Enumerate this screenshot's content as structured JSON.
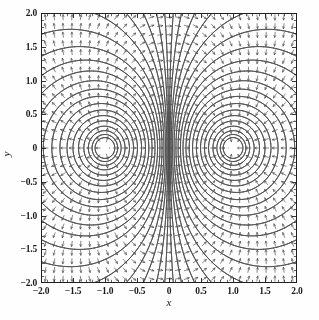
{
  "figure": {
    "width": 319,
    "height": 320,
    "background": "#fefefe",
    "ink_color": "#3a3a3a",
    "frame_color": "#1f1f1f"
  },
  "axes": {
    "frame": {
      "left": 41,
      "top": 13,
      "right": 297,
      "bottom": 283
    },
    "x_title": "x",
    "y_title": "y",
    "xlim": [
      -2.0,
      2.0
    ],
    "ylim": [
      -2.0,
      2.0
    ],
    "xticks": [
      -2.0,
      -1.5,
      -1.0,
      -0.5,
      0,
      0.5,
      1.0,
      1.5,
      2.0
    ],
    "xticklabels": [
      "-2.0",
      "-1.5",
      "-1.0",
      "-0.5",
      "0",
      "0.5",
      "1.0",
      "1.5",
      "2.0"
    ],
    "yticks": [
      -2.0,
      -1.5,
      -1.0,
      -0.5,
      0,
      0.5,
      1.0,
      1.5,
      2.0
    ],
    "yticklabels": [
      "-2.0",
      "-1.5",
      "-1.0",
      "-0.5",
      "0",
      "0.5",
      "1.0",
      "1.5",
      "2.0"
    ],
    "minor_ticks_per_interval": 5,
    "tick_direction": "in",
    "major_tick_length": 4,
    "minor_tick_length": 2.2,
    "grid": false,
    "legend": false,
    "title": ""
  },
  "chart_data": {
    "type": "contour-quiver",
    "title": "",
    "xlabel": "x",
    "ylabel": "y",
    "xlim": [
      -2.0,
      2.0
    ],
    "ylim": [
      -2.0,
      2.0
    ],
    "charges": [
      {
        "name": "charge-left",
        "x": -1.0,
        "y": 0.0,
        "q": 1.0
      },
      {
        "name": "charge-right",
        "x": 1.0,
        "y": 0.0,
        "q": -1.0
      }
    ],
    "contour": {
      "field": "potential",
      "levels": [
        -6.0,
        -4.5,
        -3.4,
        -2.6,
        -2.0,
        -1.6,
        -1.3,
        -1.05,
        -0.85,
        -0.7,
        -0.57,
        -0.46,
        -0.37,
        -0.29,
        -0.22,
        -0.16,
        -0.11,
        -0.07,
        -0.035,
        -0.012,
        0.012,
        0.035,
        0.07,
        0.11,
        0.16,
        0.22,
        0.29,
        0.37,
        0.46,
        0.57,
        0.7,
        0.85,
        1.05,
        1.3,
        1.6,
        2.0,
        2.6,
        3.4,
        4.5,
        6.0
      ],
      "line_color": "#4a4a4a",
      "line_width": 0.8
    },
    "quiver": {
      "field": "electric-field-direction",
      "grid_nx": 29,
      "grid_ny": 31,
      "arrow_length_px": 5.0,
      "normalized": true,
      "color": "#555555"
    },
    "grid": false,
    "legend_position": "none"
  }
}
